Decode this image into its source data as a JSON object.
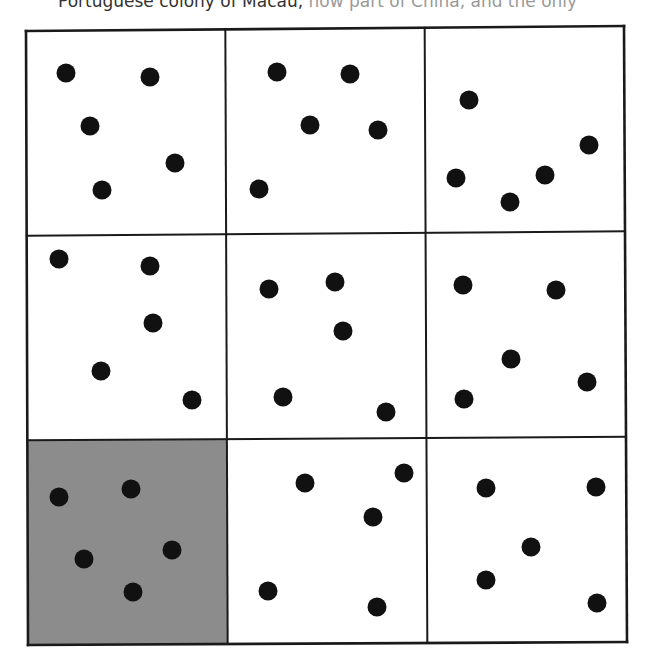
{
  "caption": {
    "text": "Portuguese colony of Macau,",
    "faded_text": " now part of China, and the only"
  },
  "grid": {
    "rows": 3,
    "cols": 3,
    "corners": {
      "tl": [
        26,
        31
      ],
      "tr": [
        624,
        26
      ],
      "br": [
        627,
        642
      ],
      "bl": [
        28,
        645
      ]
    },
    "line_color": "#1a1a1a",
    "cell_fill": "#ffffff",
    "shaded_fill": "#8c8c8c",
    "dot_color": "#111111",
    "dot_radius": 9.5,
    "cells": [
      {
        "id": "cell-1",
        "row": 0,
        "col": 0,
        "shaded": false,
        "dots": [
          [
            66,
            73
          ],
          [
            150,
            77
          ],
          [
            90,
            126
          ],
          [
            175,
            163
          ],
          [
            102,
            190
          ]
        ]
      },
      {
        "id": "cell-2",
        "row": 0,
        "col": 1,
        "shaded": false,
        "dots": [
          [
            277,
            72
          ],
          [
            350,
            74
          ],
          [
            310,
            125
          ],
          [
            378,
            130
          ],
          [
            259,
            189
          ]
        ]
      },
      {
        "id": "cell-3",
        "row": 0,
        "col": 2,
        "shaded": false,
        "dots": [
          [
            469,
            100
          ],
          [
            589,
            145
          ],
          [
            456,
            178
          ],
          [
            545,
            175
          ],
          [
            510,
            202
          ]
        ]
      },
      {
        "id": "cell-4",
        "row": 1,
        "col": 0,
        "shaded": false,
        "dots": [
          [
            59,
            259
          ],
          [
            150,
            266
          ],
          [
            153,
            323
          ],
          [
            101,
            371
          ],
          [
            192,
            400
          ]
        ]
      },
      {
        "id": "cell-5",
        "row": 1,
        "col": 1,
        "shaded": false,
        "dots": [
          [
            269,
            289
          ],
          [
            335,
            282
          ],
          [
            343,
            331
          ],
          [
            283,
            397
          ],
          [
            386,
            412
          ]
        ]
      },
      {
        "id": "cell-6",
        "row": 1,
        "col": 2,
        "shaded": false,
        "dots": [
          [
            463,
            285
          ],
          [
            556,
            290
          ],
          [
            511,
            359
          ],
          [
            587,
            382
          ],
          [
            464,
            399
          ]
        ]
      },
      {
        "id": "cell-7",
        "row": 2,
        "col": 0,
        "shaded": true,
        "dots": [
          [
            59,
            497
          ],
          [
            131,
            489
          ],
          [
            84,
            559
          ],
          [
            172,
            550
          ],
          [
            133,
            592
          ]
        ]
      },
      {
        "id": "cell-8",
        "row": 2,
        "col": 1,
        "shaded": false,
        "dots": [
          [
            305,
            483
          ],
          [
            404,
            473
          ],
          [
            373,
            517
          ],
          [
            268,
            591
          ],
          [
            377,
            607
          ]
        ]
      },
      {
        "id": "cell-9",
        "row": 2,
        "col": 2,
        "shaded": false,
        "dots": [
          [
            486,
            488
          ],
          [
            596,
            487
          ],
          [
            531,
            547
          ],
          [
            486,
            580
          ],
          [
            597,
            603
          ]
        ]
      }
    ]
  }
}
